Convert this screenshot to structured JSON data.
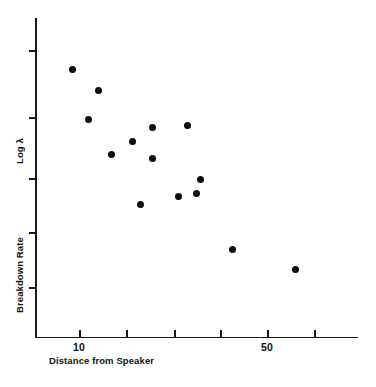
{
  "chart_data": {
    "type": "scatter",
    "title": "",
    "xlabel": "Distance from Speaker",
    "ylabel": "Log λ Breakdown Rate",
    "ylabel_parts": [
      "Log λ",
      "Breakdown Rate"
    ],
    "grid": false,
    "legend": null,
    "xscale": "log",
    "x_tick_labels": [
      "10",
      "",
      "",
      "",
      "50",
      ""
    ],
    "x_tick_values": [
      10,
      15,
      22,
      33,
      50,
      75
    ],
    "y_tick_labels": [
      "",
      "",
      "",
      "",
      "",
      ""
    ],
    "xlim": [
      8,
      90
    ],
    "ylim": [
      0,
      1
    ],
    "points": [
      {
        "x": 9.6,
        "y": 0.855
      },
      {
        "x": 11.8,
        "y": 0.79
      },
      {
        "x": 11.0,
        "y": 0.7
      },
      {
        "x": 18.5,
        "y": 0.665
      },
      {
        "x": 24.5,
        "y": 0.663
      },
      {
        "x": 15.3,
        "y": 0.627
      },
      {
        "x": 13.1,
        "y": 0.588
      },
      {
        "x": 18.3,
        "y": 0.57
      },
      {
        "x": 26.5,
        "y": 0.498
      },
      {
        "x": 25.3,
        "y": 0.462
      },
      {
        "x": 22.0,
        "y": 0.455
      },
      {
        "x": 16.3,
        "y": 0.42
      },
      {
        "x": 36.5,
        "y": 0.265
      },
      {
        "x": 60.0,
        "y": 0.207
      }
    ],
    "point_count": 14,
    "marker": "filled-circle",
    "marker_color": "#0d0d0d",
    "annotations": []
  },
  "figure": {
    "background_color": "#ffffff",
    "axis_color": "#1a1a1a",
    "text_color": "#111111"
  },
  "pixel_layout": {
    "x_axis_ticks_px": [
      79,
      126,
      174,
      220,
      267,
      314
    ],
    "x_axis_tick_texts": [
      "10",
      "",
      "",
      "",
      "50",
      ""
    ],
    "y_axis_ticks_px": [
      50,
      117,
      178,
      232,
      287
    ],
    "points_px": [
      {
        "cx": 72,
        "cy": 69
      },
      {
        "cx": 98,
        "cy": 90
      },
      {
        "cx": 88,
        "cy": 119
      },
      {
        "cx": 152,
        "cy": 127
      },
      {
        "cx": 187,
        "cy": 125
      },
      {
        "cx": 132,
        "cy": 141
      },
      {
        "cx": 111,
        "cy": 154
      },
      {
        "cx": 152,
        "cy": 158
      },
      {
        "cx": 200,
        "cy": 179
      },
      {
        "cx": 196,
        "cy": 193
      },
      {
        "cx": 178,
        "cy": 196
      },
      {
        "cx": 140,
        "cy": 204
      },
      {
        "cx": 232,
        "cy": 249
      },
      {
        "cx": 295,
        "cy": 269
      }
    ]
  }
}
